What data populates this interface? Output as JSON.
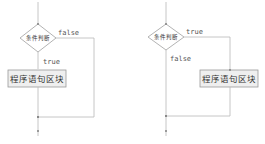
{
  "colors": {
    "line": "#b8b8b8",
    "box_fill": "#efefef",
    "box_stroke": "#9a9a9a",
    "text": "#333333"
  },
  "diagrams": [
    {
      "name": "left",
      "decision": {
        "label": "条件判断"
      },
      "branch_right_label": "false",
      "branch_down_label": "true",
      "block": {
        "label": "程序语句区块"
      }
    },
    {
      "name": "right",
      "decision": {
        "label": "条件判断"
      },
      "branch_right_label": "true",
      "branch_down_label": "false",
      "block": {
        "label": "程序语句区块"
      }
    }
  ]
}
